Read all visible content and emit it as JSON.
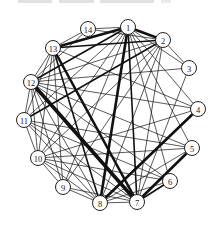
{
  "diagram": {
    "type": "network-graph",
    "nodes": [
      {
        "id": "1",
        "x": 128,
        "y": 27
      },
      {
        "id": "2",
        "x": 163,
        "y": 40
      },
      {
        "id": "3",
        "x": 189,
        "y": 68
      },
      {
        "id": "4",
        "x": 198,
        "y": 109
      },
      {
        "id": "5",
        "x": 192,
        "y": 148
      },
      {
        "id": "6",
        "x": 170,
        "y": 181
      },
      {
        "id": "7",
        "x": 137,
        "y": 202
      },
      {
        "id": "8",
        "x": 100,
        "y": 203
      },
      {
        "id": "9",
        "x": 63,
        "y": 187
      },
      {
        "id": "10",
        "x": 38,
        "y": 158
      },
      {
        "id": "11",
        "x": 24,
        "y": 120
      },
      {
        "id": "12",
        "x": 31,
        "y": 82
      },
      {
        "id": "13",
        "x": 53,
        "y": 48
      },
      {
        "id": "14",
        "x": 88,
        "y": 29
      }
    ],
    "edges": [
      [
        "1",
        "2",
        3
      ],
      [
        "1",
        "13",
        3
      ],
      [
        "1",
        "14",
        1
      ],
      [
        "1",
        "3",
        1
      ],
      [
        "1",
        "8",
        3
      ],
      [
        "1",
        "7",
        2
      ],
      [
        "1",
        "12",
        2
      ],
      [
        "1",
        "11",
        1
      ],
      [
        "1",
        "10",
        1
      ],
      [
        "1",
        "9",
        1
      ],
      [
        "1",
        "6",
        1
      ],
      [
        "1",
        "5",
        1
      ],
      [
        "1",
        "4",
        1
      ],
      [
        "2",
        "13",
        2
      ],
      [
        "2",
        "11",
        2
      ],
      [
        "2",
        "3",
        1
      ],
      [
        "2",
        "7",
        1
      ],
      [
        "2",
        "10",
        1
      ],
      [
        "2",
        "12",
        1
      ],
      [
        "2",
        "9",
        1
      ],
      [
        "2",
        "8",
        1
      ],
      [
        "3",
        "7",
        1
      ],
      [
        "3",
        "12",
        1
      ],
      [
        "4",
        "8",
        3
      ],
      [
        "4",
        "12",
        1
      ],
      [
        "4",
        "13",
        1
      ],
      [
        "4",
        "10",
        1
      ],
      [
        "5",
        "7",
        3
      ],
      [
        "5",
        "10",
        1
      ],
      [
        "5",
        "11",
        1
      ],
      [
        "5",
        "12",
        1
      ],
      [
        "5",
        "8",
        1
      ],
      [
        "6",
        "7",
        2
      ],
      [
        "6",
        "10",
        1
      ],
      [
        "6",
        "12",
        1
      ],
      [
        "6",
        "8",
        1
      ],
      [
        "6",
        "11",
        1
      ],
      [
        "7",
        "12",
        4
      ],
      [
        "7",
        "13",
        3
      ],
      [
        "7",
        "8",
        1
      ],
      [
        "7",
        "10",
        1
      ],
      [
        "7",
        "11",
        1
      ],
      [
        "7",
        "9",
        1
      ],
      [
        "8",
        "12",
        1
      ],
      [
        "8",
        "13",
        2
      ],
      [
        "8",
        "11",
        1
      ],
      [
        "8",
        "10",
        1
      ],
      [
        "8",
        "9",
        1
      ],
      [
        "9",
        "13",
        1
      ],
      [
        "9",
        "10",
        1
      ],
      [
        "9",
        "12",
        1
      ],
      [
        "10",
        "11",
        1
      ],
      [
        "10",
        "13",
        1
      ],
      [
        "10",
        "12",
        1
      ],
      [
        "11",
        "12",
        1
      ],
      [
        "11",
        "13",
        1
      ],
      [
        "12",
        "13",
        1
      ],
      [
        "13",
        "14",
        1
      ],
      [
        "12",
        "14",
        1
      ],
      [
        "14",
        "2",
        1
      ]
    ]
  }
}
